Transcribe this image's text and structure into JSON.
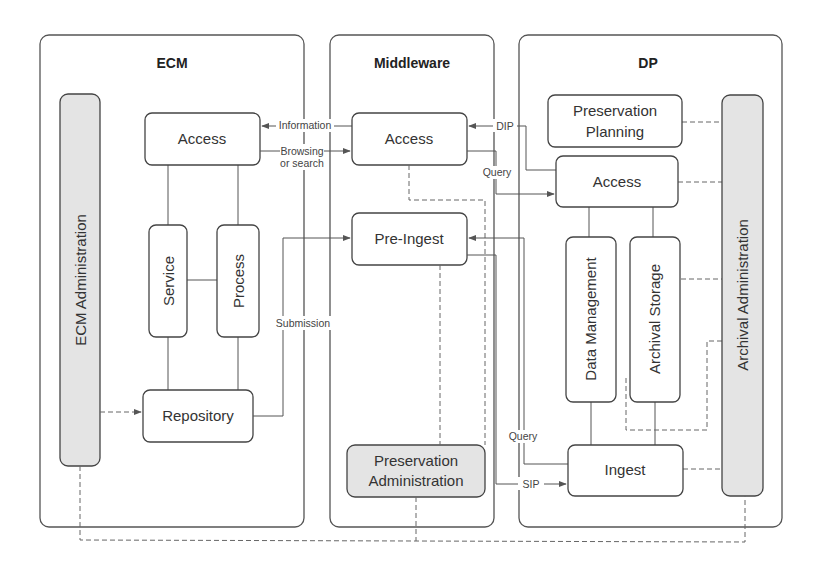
{
  "panels": {
    "ecm": {
      "title": "ECM"
    },
    "middleware": {
      "title": "Middleware"
    },
    "dp": {
      "title": "DP"
    }
  },
  "ecm": {
    "access": "Access",
    "service": "Service",
    "process": "Process",
    "repository": "Repository",
    "administration": "ECM Administration"
  },
  "middleware": {
    "access": "Access",
    "pre_ingest": "Pre-Ingest",
    "preservation_admin_line1": "Preservation",
    "preservation_admin_line2": "Administration"
  },
  "dp": {
    "preservation_planning_line1": "Preservation",
    "preservation_planning_line2": "Planning",
    "access": "Access",
    "data_management": "Data Management",
    "archival_storage": "Archival Storage",
    "ingest": "Ingest",
    "archival_administration": "Archival Administration"
  },
  "edges": {
    "information": "Information",
    "browsing_line1": "Browsing",
    "browsing_line2": "or search",
    "submission": "Submission",
    "dip": "DIP",
    "query_top": "Query",
    "query_bottom": "Query",
    "sip": "SIP"
  },
  "colors": {
    "panel_border": "#555555",
    "box_border": "#444444",
    "admin_fill": "#e4e4e4",
    "background": "#ffffff"
  }
}
